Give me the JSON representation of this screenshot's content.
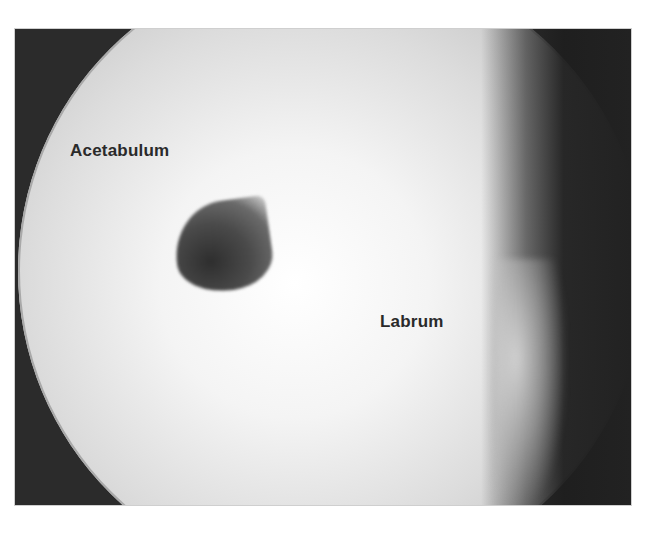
{
  "image": {
    "type": "arthroscopic-view",
    "background_color": "#2b2b2b",
    "field_color": "#f0f0f0"
  },
  "labels": {
    "acetabulum": "Acetabulum",
    "labrum": "Labrum"
  }
}
